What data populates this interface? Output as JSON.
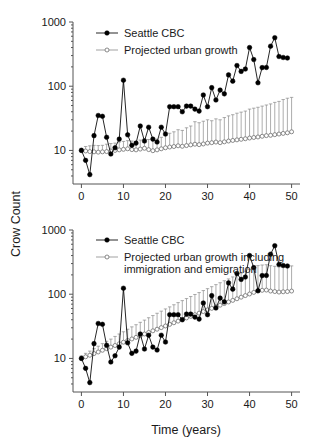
{
  "figure": {
    "ylabel": "Crow Count",
    "xlabel": "Time (years)"
  },
  "chart_data": [
    {
      "type": "line",
      "panel": "top",
      "title": "",
      "xlabel": "",
      "ylabel": "Crow Count",
      "xlim": [
        -2,
        52
      ],
      "ylim": [
        3,
        1000
      ],
      "yscale": "log",
      "xticks": [
        0,
        10,
        20,
        30,
        40,
        50
      ],
      "yticks": [
        10,
        100,
        1000
      ],
      "ytick_labels": [
        "10",
        "100",
        "1000"
      ],
      "grid": false,
      "legend_position": "top-left",
      "legend": [
        "Seattle CBC",
        "Projected urban growth"
      ],
      "x": [
        0,
        1,
        2,
        3,
        4,
        5,
        6,
        7,
        8,
        9,
        10,
        11,
        12,
        13,
        14,
        15,
        16,
        17,
        18,
        19,
        20,
        21,
        22,
        23,
        24,
        25,
        26,
        27,
        28,
        29,
        30,
        31,
        32,
        33,
        34,
        35,
        36,
        37,
        38,
        39,
        40,
        41,
        42,
        43,
        44,
        45,
        46,
        47,
        48,
        49,
        50
      ],
      "series": [
        {
          "name": "Seattle CBC",
          "marker": "filled-circle",
          "values": [
            10,
            7,
            4.2,
            17,
            35,
            34,
            16,
            8.8,
            11,
            15,
            124,
            17.5,
            12,
            13,
            24,
            14,
            23,
            15,
            13.5,
            23,
            18,
            48,
            48,
            48,
            40,
            49,
            49,
            44,
            41,
            73,
            48,
            95,
            61,
            87,
            76,
            150,
            120,
            210,
            170,
            185,
            400,
            260,
            113,
            195,
            196,
            420,
            570,
            290,
            280,
            275
          ]
        },
        {
          "name": "Projected urban growth",
          "marker": "open-circle",
          "values": [
            10.0,
            9.8,
            9.6,
            9.5,
            9.4,
            9.5,
            9.6,
            9.8,
            10.0,
            10.2,
            10.4,
            10.6,
            10.3,
            10.2,
            10.5,
            10.8,
            10.3,
            9.9,
            10.2,
            10.6,
            11.0,
            11.3,
            11.5,
            11.8,
            11.6,
            11.9,
            12.2,
            12.5,
            12.3,
            12.6,
            13.0,
            13.2,
            13.5,
            13.2,
            13.6,
            14.0,
            14.3,
            14.6,
            14.9,
            15.2,
            15.6,
            15.9,
            16.2,
            16.6,
            17.0,
            17.2,
            17.6,
            18.0,
            18.4,
            18.8,
            19.5
          ],
          "error_upper": [
            10.8,
            11.5,
            11.8,
            12.0,
            11.9,
            12.0,
            12.5,
            12.8,
            13.0,
            13.5,
            13.8,
            14.2,
            14.0,
            13.8,
            14.5,
            15.2,
            14.8,
            14.2,
            15.0,
            16.0,
            17.0,
            18.5,
            19.5,
            21.0,
            20.5,
            22.5,
            24.0,
            28.0,
            27.0,
            28.5,
            30.0,
            29.0,
            31.0,
            30.0,
            32.5,
            34.5,
            36.0,
            38.0,
            39.5,
            41.0,
            44.0,
            45.5,
            47.0,
            49.0,
            51.0,
            53.0,
            56.0,
            58.0,
            62.0,
            65.0,
            67.0
          ]
        }
      ]
    },
    {
      "type": "line",
      "panel": "bottom",
      "title": "",
      "xlabel": "Time (years)",
      "ylabel": "Crow Count",
      "xlim": [
        -2,
        52
      ],
      "ylim": [
        3,
        1000
      ],
      "yscale": "log",
      "xticks": [
        0,
        10,
        20,
        30,
        40,
        50
      ],
      "yticks": [
        10,
        100,
        1000
      ],
      "ytick_labels": [
        "10",
        "100",
        "1000"
      ],
      "grid": false,
      "legend_position": "top-left",
      "legend": [
        "Seattle CBC",
        "Projected urban growth including immigration and emigration"
      ],
      "x": [
        0,
        1,
        2,
        3,
        4,
        5,
        6,
        7,
        8,
        9,
        10,
        11,
        12,
        13,
        14,
        15,
        16,
        17,
        18,
        19,
        20,
        21,
        22,
        23,
        24,
        25,
        26,
        27,
        28,
        29,
        30,
        31,
        32,
        33,
        34,
        35,
        36,
        37,
        38,
        39,
        40,
        41,
        42,
        43,
        44,
        45,
        46,
        47,
        48,
        49,
        50
      ],
      "series": [
        {
          "name": "Seattle CBC",
          "marker": "filled-circle",
          "values": [
            10,
            7,
            4.2,
            17,
            35,
            34,
            16,
            8.8,
            11,
            15,
            124,
            17.5,
            12,
            13,
            24,
            14,
            23,
            15,
            13.5,
            23,
            18,
            48,
            48,
            48,
            40,
            49,
            49,
            44,
            41,
            73,
            48,
            95,
            61,
            87,
            76,
            150,
            120,
            210,
            170,
            185,
            400,
            260,
            113,
            195,
            196,
            420,
            570,
            290,
            280,
            275
          ]
        },
        {
          "name": "Projected urban growth including immigration and emigration",
          "marker": "open-circle",
          "values": [
            10.0,
            10.6,
            11.2,
            11.9,
            12.6,
            13.4,
            14.2,
            15.0,
            15.9,
            16.9,
            17.9,
            19.0,
            20.1,
            21.3,
            22.6,
            24.0,
            25.4,
            26.9,
            28.5,
            30.2,
            32.0,
            33.9,
            35.9,
            38.1,
            40.3,
            42.7,
            45.2,
            47.9,
            50.7,
            53.7,
            56.9,
            60.2,
            63.8,
            67.5,
            71.5,
            75.7,
            80.2,
            84.9,
            89.9,
            95.2,
            100.8,
            106.7,
            113.0,
            115.0,
            116.0,
            112.0,
            110.0,
            108.0,
            109.0,
            110.0,
            112.0
          ],
          "error_upper": [
            11.0,
            12.0,
            13.0,
            14.2,
            15.5,
            17.0,
            18.5,
            20.0,
            22.0,
            24.0,
            26.0,
            28.5,
            31.0,
            33.5,
            36.5,
            39.5,
            43.0,
            46.5,
            50.5,
            54.5,
            59.0,
            63.5,
            68.5,
            74.0,
            79.5,
            85.5,
            92.0,
            99.0,
            106.0,
            114.0,
            122.0,
            131.0,
            141.0,
            151.0,
            162.0,
            173.0,
            186.0,
            199.0,
            213.0,
            228.0,
            244.0,
            261.0,
            279.0,
            285.0,
            288.0,
            278.0,
            272.0,
            266.0,
            268.0,
            271.0,
            276.0
          ]
        }
      ]
    }
  ]
}
